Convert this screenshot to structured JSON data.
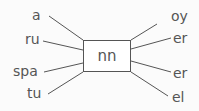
{
  "diagram": {
    "center": "nn",
    "left_labels": [
      "a",
      "ru",
      "spa",
      "tu"
    ],
    "right_labels": [
      "oy",
      "er",
      "er",
      "el"
    ],
    "colors": {
      "line": "#555555",
      "text": "#555555",
      "background": "#fbfbfb"
    }
  }
}
